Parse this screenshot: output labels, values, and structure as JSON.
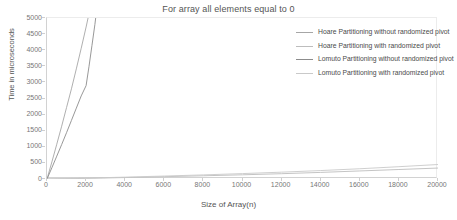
{
  "chart_data": {
    "type": "line",
    "title": "For array all elements equal to 0",
    "xlabel": "Size of Array(n)",
    "ylabel": "Time in microseconds",
    "xlim": [
      0,
      20000
    ],
    "ylim": [
      0,
      5000
    ],
    "xticks": [
      0,
      2000,
      4000,
      6000,
      8000,
      10000,
      12000,
      14000,
      16000,
      18000,
      20000
    ],
    "yticks": [
      0,
      500,
      1000,
      1500,
      2000,
      2500,
      3000,
      3500,
      4000,
      4500,
      5000
    ],
    "grid": false,
    "legend_position": "right",
    "series": [
      {
        "name": "Hoare Partitioning without randomized pivot",
        "color": "#a6a6a6",
        "x": [
          0,
          250,
          500,
          750,
          1000,
          1250,
          1500,
          1750,
          2000,
          2100,
          2200,
          2300
        ],
        "y": [
          0,
          530,
          1080,
          1640,
          2220,
          2800,
          3420,
          4060,
          4720,
          5000,
          5400,
          5850
        ]
      },
      {
        "name": "Hoare Partitioning with randomized pivot",
        "color": "#bdbdbd",
        "x": [
          0,
          2000,
          4000,
          6000,
          8000,
          10000,
          12000,
          14000,
          16000,
          18000,
          20000
        ],
        "y": [
          0,
          20,
          45,
          72,
          100,
          130,
          165,
          205,
          250,
          295,
          340
        ]
      },
      {
        "name": "Lomuto Partitioning without randomized pivot",
        "color": "#8c8c8c",
        "x": [
          0,
          250,
          500,
          750,
          1000,
          1250,
          1500,
          1750,
          2000,
          2150,
          2300,
          2450,
          2550
        ],
        "y": [
          0,
          350,
          710,
          1070,
          1440,
          1820,
          2200,
          2580,
          2900,
          3500,
          4150,
          4800,
          5300
        ]
      },
      {
        "name": "Lomuto Partitioning with randomized pivot",
        "color": "#c9c9c9",
        "x": [
          0,
          2000,
          4000,
          6000,
          8000,
          10000,
          12000,
          14000,
          16000,
          18000,
          20000
        ],
        "y": [
          0,
          28,
          58,
          92,
          128,
          168,
          212,
          262,
          318,
          382,
          450
        ]
      }
    ]
  }
}
